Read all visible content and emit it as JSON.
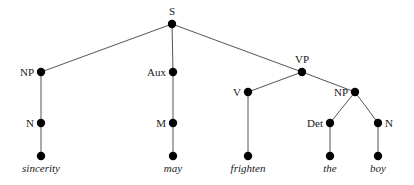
{
  "diagram": {
    "type": "syntax-tree",
    "colors": {
      "edge": "#555555",
      "node": "#000000",
      "text": "#1a1a1a"
    },
    "nodes": [
      {
        "id": "S",
        "label": "S",
        "x": 172,
        "y": 24,
        "label_pos": "top"
      },
      {
        "id": "NP1",
        "label": "NP",
        "x": 41,
        "y": 72,
        "label_pos": "left"
      },
      {
        "id": "Aux",
        "label": "Aux",
        "x": 173,
        "y": 72,
        "label_pos": "left"
      },
      {
        "id": "VP",
        "label": "VP",
        "x": 302,
        "y": 72,
        "label_pos": "top"
      },
      {
        "id": "N1",
        "label": "N",
        "x": 41,
        "y": 123,
        "label_pos": "left"
      },
      {
        "id": "M",
        "label": "M",
        "x": 173,
        "y": 123,
        "label_pos": "left"
      },
      {
        "id": "V",
        "label": "V",
        "x": 248,
        "y": 92,
        "label_pos": "left"
      },
      {
        "id": "NP2",
        "label": "NP",
        "x": 355,
        "y": 92,
        "label_pos": "left"
      },
      {
        "id": "Det",
        "label": "Det",
        "x": 330,
        "y": 123,
        "label_pos": "left"
      },
      {
        "id": "N2",
        "label": "N",
        "x": 378,
        "y": 123,
        "label_pos": "right"
      },
      {
        "id": "L1",
        "label": "sincerity",
        "x": 41,
        "y": 156,
        "label_pos": "bottom",
        "leaf": true
      },
      {
        "id": "L2",
        "label": "may",
        "x": 173,
        "y": 156,
        "label_pos": "bottom",
        "leaf": true
      },
      {
        "id": "L3",
        "label": "frighten",
        "x": 248,
        "y": 156,
        "label_pos": "bottom",
        "leaf": true
      },
      {
        "id": "L4",
        "label": "the",
        "x": 330,
        "y": 156,
        "label_pos": "bottom",
        "leaf": true
      },
      {
        "id": "L5",
        "label": "boy",
        "x": 378,
        "y": 156,
        "label_pos": "bottom",
        "leaf": true
      }
    ],
    "edges": [
      [
        "S",
        "NP1"
      ],
      [
        "S",
        "Aux"
      ],
      [
        "S",
        "VP"
      ],
      [
        "NP1",
        "N1"
      ],
      [
        "N1",
        "L1"
      ],
      [
        "Aux",
        "M"
      ],
      [
        "M",
        "L2"
      ],
      [
        "VP",
        "V"
      ],
      [
        "VP",
        "NP2"
      ],
      [
        "V",
        "L3"
      ],
      [
        "NP2",
        "Det"
      ],
      [
        "NP2",
        "N2"
      ],
      [
        "Det",
        "L4"
      ],
      [
        "N2",
        "L5"
      ]
    ]
  }
}
